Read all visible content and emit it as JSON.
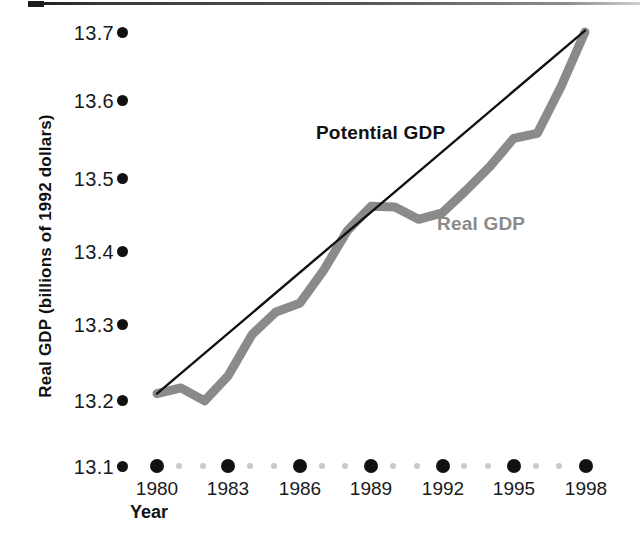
{
  "chart_data": {
    "type": "line",
    "title": "",
    "xlabel": "Year",
    "ylabel": "Real GDP (billions of 1992 dollars)",
    "xlim": [
      1979,
      1999
    ],
    "ylim": [
      13.1,
      13.7
    ],
    "grid": false,
    "legend_position": "inline-annotations",
    "xticks": [
      "1980",
      "1983",
      "1986",
      "1989",
      "1992",
      "1995",
      "1998"
    ],
    "xtick_values": [
      1980,
      1983,
      1986,
      1989,
      1992,
      1995,
      1998
    ],
    "yticks": [
      "13.1",
      "13.2",
      "13.3",
      "13.4",
      "13.5",
      "13.6",
      "13.7"
    ],
    "ytick_values": [
      13.1,
      13.2,
      13.3,
      13.4,
      13.5,
      13.6,
      13.7
    ],
    "x": [
      1980,
      1981,
      1982,
      1983,
      1984,
      1985,
      1986,
      1987,
      1988,
      1989,
      1990,
      1991,
      1992,
      1993,
      1994,
      1995,
      1996,
      1997,
      1998
    ],
    "series": [
      {
        "name": "Potential GDP",
        "color": "#111111",
        "style": "straight-line",
        "values": [
          13.2,
          13.228,
          13.256,
          13.284,
          13.312,
          13.339,
          13.367,
          13.395,
          13.423,
          13.451,
          13.479,
          13.507,
          13.535,
          13.563,
          13.591,
          13.618,
          13.646,
          13.674,
          13.702
        ]
      },
      {
        "name": "Real GDP",
        "color": "#8a8a8a",
        "style": "thick-wavy-line",
        "values": [
          13.2,
          13.208,
          13.19,
          13.225,
          13.282,
          13.313,
          13.325,
          13.37,
          13.425,
          13.459,
          13.458,
          13.441,
          13.45,
          13.481,
          13.514,
          13.553,
          13.56,
          13.625,
          13.7
        ]
      }
    ],
    "annotations": [
      {
        "text": "Potential GDP",
        "color": "#111111"
      },
      {
        "text": "Real GDP",
        "color": "#8a8a8a"
      }
    ]
  },
  "axes": {
    "y_title": "Real GDP (billions of 1992 dollars)",
    "x_title": "Year",
    "y_tick_labels": [
      "13.7",
      "13.6",
      "13.5",
      "13.4",
      "13.3",
      "13.2",
      "13.1"
    ],
    "x_tick_labels": [
      "1980",
      "1983",
      "1986",
      "1989",
      "1992",
      "1995",
      "1998"
    ]
  },
  "labels": {
    "potential_gdp": "Potential GDP",
    "real_gdp": "Real GDP"
  },
  "colors": {
    "potential_line": "#111111",
    "real_line": "#8a8a8a",
    "text": "#111111",
    "background": "#ffffff",
    "minor_tick": "#c9c9c9"
  }
}
